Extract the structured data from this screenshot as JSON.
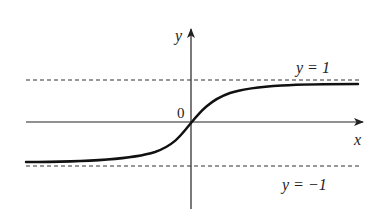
{
  "figure": {
    "type": "function-graph",
    "axes": {
      "x_label": "x",
      "y_label": "y",
      "origin_label": "0"
    },
    "asymptotes": [
      {
        "label": "y = 1",
        "value": 1,
        "style": "dashed"
      },
      {
        "label": "y = −1",
        "value": -1,
        "style": "dashed"
      }
    ],
    "curve": {
      "shape": "S-curve through origin",
      "left_limit": -1,
      "right_limit": 1
    },
    "colors": {
      "ink": "#222222",
      "background": "#ffffff"
    }
  }
}
